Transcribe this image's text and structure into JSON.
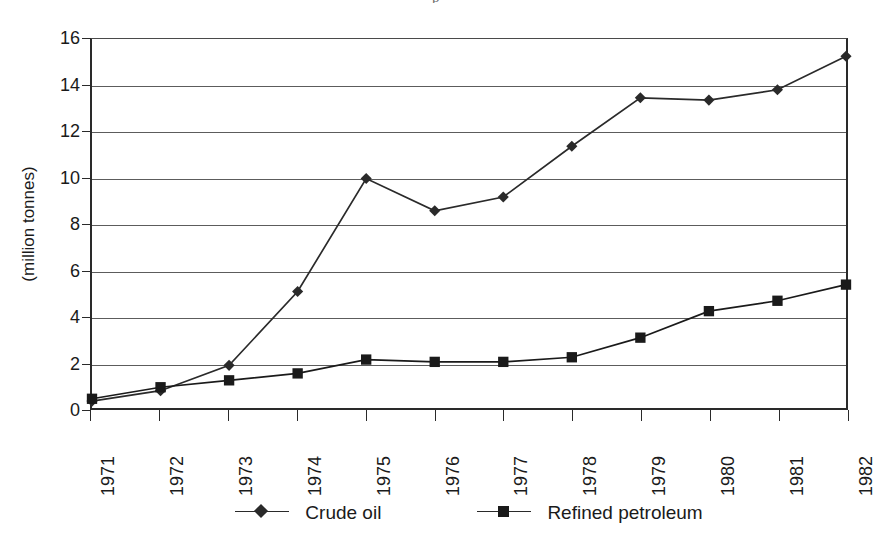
{
  "chart_data": {
    "type": "line",
    "title": "",
    "subtitle": "",
    "xlabel": "",
    "ylabel": "(million tonnes)",
    "categories": [
      "1971",
      "1972",
      "1973",
      "1974",
      "1975",
      "1976",
      "1977",
      "1978",
      "1979",
      "1980",
      "1981",
      "1982"
    ],
    "ylim": [
      0,
      16
    ],
    "ytick_step": 2,
    "yticks": [
      "0",
      "2",
      "4",
      "6",
      "8",
      "10",
      "12",
      "14",
      "16"
    ],
    "grid": "horizontal",
    "legend_position": "bottom",
    "series": [
      {
        "name": "Crude oil",
        "marker": "diamond",
        "color": "#2a2a2a",
        "values": [
          0.3,
          0.75,
          1.85,
          5.05,
          9.95,
          8.55,
          9.15,
          11.35,
          13.45,
          13.35,
          13.8,
          15.25
        ]
      },
      {
        "name": "Refined petroleum",
        "marker": "square",
        "color": "#1a1a1a",
        "values": [
          0.4,
          0.9,
          1.2,
          1.5,
          2.1,
          2.0,
          2.0,
          2.2,
          3.05,
          4.2,
          4.65,
          5.35
        ]
      }
    ]
  },
  "axes": {
    "y_title": "(million tonnes)"
  },
  "legend": {
    "items": [
      {
        "label": "Crude oil",
        "marker": "diamond"
      },
      {
        "label": "Refined petroleum",
        "marker": "square"
      }
    ]
  },
  "artifacts": {
    "top_clipped_glyph": "p"
  }
}
